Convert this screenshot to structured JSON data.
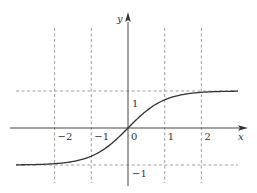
{
  "chart_data": {
    "type": "line",
    "title": "",
    "function": "y = tanh(x)",
    "xlabel": "x",
    "ylabel": "y",
    "xlim": [
      -3.05,
      3.2
    ],
    "ylim": [
      -1.4,
      2.4
    ],
    "grid": "dashed at x = -2, -1, 1, 2 and y = 1, -1 (asymptotes)",
    "x_ticks": [
      -2,
      -1,
      0,
      1,
      2
    ],
    "x_tick_labels": [
      "−2",
      "−1",
      "0",
      "1",
      "2"
    ],
    "y_ticks": [
      1,
      -1
    ],
    "y_tick_labels": [
      "1",
      "−1"
    ],
    "series": [
      {
        "name": "tanh(x)",
        "x": [
          -3,
          -2.5,
          -2,
          -1.5,
          -1,
          -0.5,
          0,
          0.5,
          1,
          1.5,
          2,
          2.5,
          3
        ],
        "y": [
          -0.995,
          -0.987,
          -0.964,
          -0.905,
          -0.762,
          -0.462,
          0,
          0.462,
          0.762,
          0.905,
          0.964,
          0.987,
          0.995
        ]
      }
    ],
    "colors": {
      "axis": "#333333",
      "curve": "#333333",
      "grid": "#888888"
    }
  }
}
